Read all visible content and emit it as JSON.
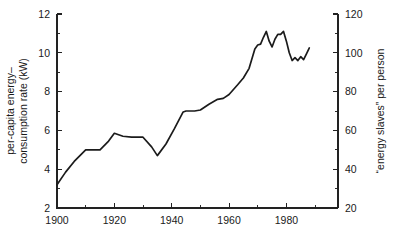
{
  "chart_data": {
    "type": "line",
    "title": "",
    "xlabel": "",
    "ylabel": "per-capita energy-\nconsumption rate (kW)",
    "ylabel_line1": "per-capita energy–",
    "ylabel_line2": "consumption rate (kW)",
    "y2label": "“energy slaves” per person",
    "xlim": [
      1900,
      1998
    ],
    "ylim": [
      2,
      12
    ],
    "y2lim": [
      20,
      120
    ],
    "grid": false,
    "legend": null,
    "x_ticks_major": [
      1900,
      1920,
      1940,
      1960,
      1980
    ],
    "x_ticks_major_labels": [
      "1900",
      "1920",
      "1940",
      "1960",
      "1980"
    ],
    "x_ticks_minor": [
      1910,
      1930,
      1950,
      1970,
      1990
    ],
    "y_ticks_major": [
      2,
      4,
      6,
      8,
      10,
      12
    ],
    "y_ticks_major_labels": [
      "2",
      "4",
      "6",
      "8",
      "10",
      "12"
    ],
    "y_ticks_minor": [
      3,
      5,
      7,
      9,
      11
    ],
    "y2_ticks_major": [
      20,
      40,
      60,
      80,
      100,
      120
    ],
    "y2_ticks_major_labels": [
      "20",
      "40",
      "60",
      "80",
      "100",
      "120"
    ],
    "y2_ticks_minor": [
      30,
      50,
      70,
      90,
      110
    ],
    "series": [
      {
        "name": "per-capita energy-consumption rate",
        "color": "#1b1b1b",
        "x": [
          1900,
          1903,
          1906,
          1910,
          1915,
          1918,
          1920,
          1923,
          1926,
          1930,
          1933,
          1935,
          1938,
          1941,
          1944,
          1945,
          1948,
          1950,
          1953,
          1956,
          1958,
          1960,
          1963,
          1965,
          1967,
          1969,
          1970,
          1971,
          1972,
          1973,
          1974,
          1975,
          1976,
          1977,
          1978,
          1979,
          1980,
          1981,
          1982,
          1983,
          1984,
          1985,
          1986,
          1987,
          1988
        ],
        "y": [
          3.2,
          3.85,
          4.4,
          5.0,
          5.0,
          5.45,
          5.85,
          5.7,
          5.65,
          5.65,
          5.15,
          4.7,
          5.3,
          6.1,
          6.95,
          7.0,
          7.0,
          7.05,
          7.35,
          7.6,
          7.65,
          7.85,
          8.35,
          8.7,
          9.2,
          10.2,
          10.4,
          10.45,
          10.8,
          11.1,
          10.6,
          10.3,
          10.7,
          10.95,
          10.95,
          11.1,
          10.6,
          10.0,
          9.6,
          9.75,
          9.6,
          9.8,
          9.65,
          9.95,
          10.25
        ]
      }
    ]
  },
  "geometry": {
    "plot_left": 57,
    "plot_right": 338,
    "plot_top": 14,
    "plot_bottom": 208
  }
}
